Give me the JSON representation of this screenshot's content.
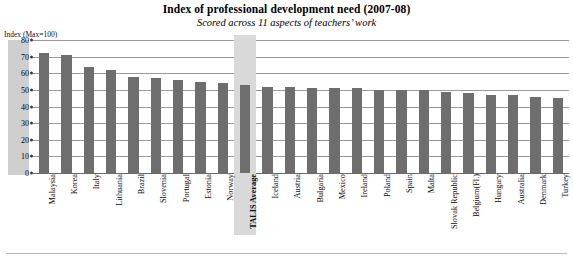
{
  "chart_data": {
    "type": "bar",
    "title": "Index of professional development need (2007-08)",
    "subtitle": "Scored across 11 aspects of teachers’ work",
    "xlabel": "",
    "ylabel": "Index (Max=100)",
    "ylim": [
      0,
      80
    ],
    "ytick_step": 10,
    "yticks": [
      "80",
      "70",
      "60",
      "50",
      "40",
      "30",
      "20",
      "10",
      "0"
    ],
    "grid": true,
    "legend": "none",
    "bar_color": "#6e6e6e",
    "highlight_color": "#d9d9d9",
    "highlight_category": "TALIS Average",
    "categories": [
      "Malaysia",
      "Korea",
      "Italy",
      "Lithuania",
      "Brazil",
      "Slovenia",
      "Portugal",
      "Estonia",
      "Norway",
      "TALIS Average",
      "Iceland",
      "Austria",
      "Bulgaria",
      "Mexico",
      "Ireland",
      "Poland",
      "Spain",
      "Malta",
      "Slovak Republic",
      "Belgium(Fl.)",
      "Hungary",
      "Australia",
      "Denmark",
      "Turkey"
    ],
    "values": [
      72,
      71,
      64,
      62,
      58,
      57,
      56,
      55,
      54,
      53,
      52,
      52,
      51,
      51,
      51,
      50,
      50,
      50,
      49,
      48,
      47,
      47,
      46,
      45
    ]
  },
  "axis_caption": "Index (Max=100)"
}
